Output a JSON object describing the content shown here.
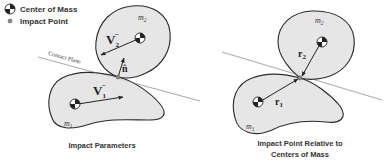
{
  "legend": {
    "items": [
      {
        "icon": "center-of-mass-icon",
        "label": "Center of Mass"
      },
      {
        "icon": "impact-point-icon",
        "label": "Impact Point"
      }
    ]
  },
  "left_panel": {
    "caption": "Impact Parameters",
    "upper_body_label": "m",
    "upper_body_sub": "2",
    "lower_body_label": "m",
    "lower_body_sub": "1",
    "velocity_2_label": "V",
    "velocity_2_sub": "2",
    "velocity_2_sup": "−",
    "velocity_1_label": "V",
    "velocity_1_sub": "1",
    "velocity_1_sup": "−",
    "normal_label": "n̂",
    "contact_plane_label": "Contact Plane"
  },
  "right_panel": {
    "caption_line1": "Impact Point Relative to",
    "caption_line2": "Centers of Mass",
    "upper_body_label": "m",
    "upper_body_sub": "2",
    "lower_body_label": "m",
    "lower_body_sub": "1",
    "r2_label": "r",
    "r2_sub": "2",
    "r1_label": "r",
    "r1_sub": "1"
  },
  "colors": {
    "body_fill": "#e6e6e6",
    "outline": "#2a2a2a",
    "plane_line": "#9a9a9a",
    "text": "#333333"
  }
}
